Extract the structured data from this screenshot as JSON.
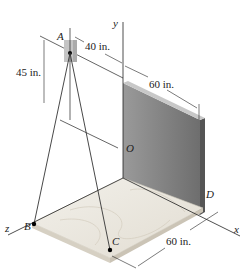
{
  "figure": {
    "points": {
      "A": "A",
      "B": "B",
      "C": "C",
      "D": "D",
      "O": "O"
    },
    "axes": {
      "x": "x",
      "y": "y",
      "z": "z"
    },
    "dimensions": {
      "d1": "40 in.",
      "d2": "45 in.",
      "d3": "60 in.",
      "d4": "60 in."
    }
  }
}
